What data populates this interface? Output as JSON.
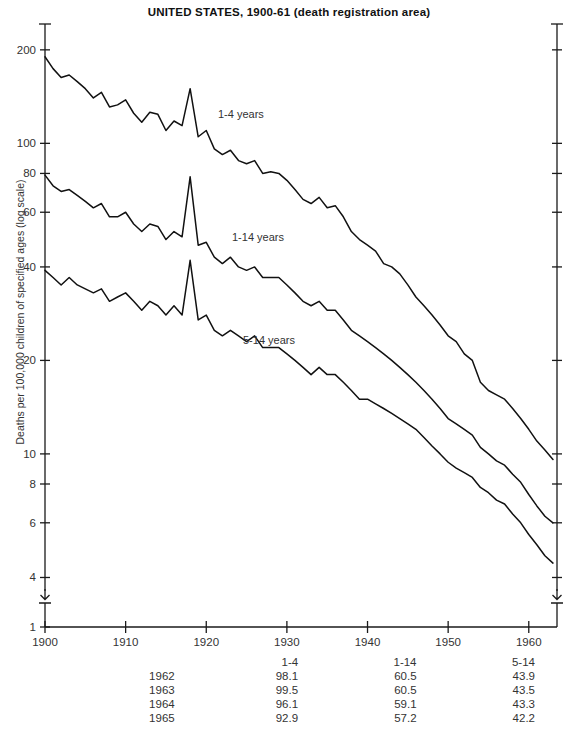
{
  "chart_data": {
    "type": "line",
    "title": "UNITED STATES, 1900-61 (death registration area)",
    "ylabel": "Deaths per 100,000 children of specified ages (log scale)",
    "xlabel": "",
    "scale": "log",
    "grid": false,
    "legend_position": "inline-annotations",
    "xlim": [
      1900,
      1963.5
    ],
    "ylim": [
      3.7,
      230
    ],
    "xticks": [
      1900,
      1910,
      1920,
      1930,
      1940,
      1950,
      1960
    ],
    "xtick_labels": [
      "1900",
      "1910",
      "1920",
      "1930",
      "1940",
      "1950",
      "1960"
    ],
    "yticks": [
      200,
      100,
      80,
      60,
      40,
      20,
      10,
      8,
      6,
      4,
      1
    ],
    "ytick_labels": [
      "200",
      "100",
      "80",
      "60",
      "40",
      "20",
      "10",
      "8",
      "6",
      "4",
      "1"
    ],
    "axis_break": true,
    "x": [
      1900,
      1901,
      1902,
      1903,
      1904,
      1905,
      1906,
      1907,
      1908,
      1909,
      1910,
      1911,
      1912,
      1913,
      1914,
      1915,
      1916,
      1917,
      1918,
      1919,
      1920,
      1921,
      1922,
      1923,
      1924,
      1925,
      1926,
      1927,
      1928,
      1929,
      1930,
      1931,
      1932,
      1933,
      1934,
      1935,
      1936,
      1937,
      1938,
      1939,
      1940,
      1941,
      1942,
      1943,
      1944,
      1945,
      1946,
      1947,
      1948,
      1949,
      1950,
      1951,
      1952,
      1953,
      1954,
      1955,
      1956,
      1957,
      1958,
      1959,
      1960,
      1961,
      1962,
      1963
    ],
    "series": [
      {
        "name": "1-4 years",
        "label": "1-4 years",
        "values": [
          190,
          174,
          163,
          166,
          158,
          150,
          140,
          146,
          131,
          133,
          138,
          125,
          117,
          126,
          124,
          110,
          118,
          114,
          150,
          105,
          110,
          96,
          92,
          95,
          88,
          86,
          88,
          80,
          81,
          80,
          76,
          71,
          66,
          64,
          67,
          62,
          63,
          58,
          52,
          49,
          47,
          45,
          41,
          40,
          38,
          35,
          32,
          30,
          28,
          26,
          24,
          23,
          21,
          20,
          17,
          16,
          15.5,
          15,
          14,
          13,
          12,
          11,
          10.3,
          9.6
        ]
      },
      {
        "name": "1-14 years",
        "label": "1-14 years",
        "values": [
          79,
          73,
          70,
          71,
          68,
          65,
          62,
          64,
          58,
          58,
          60,
          55,
          52,
          55,
          54,
          49,
          52,
          50,
          78,
          47,
          48,
          43,
          41,
          43,
          40,
          39,
          40,
          37,
          37,
          37,
          35,
          33,
          31,
          30,
          31,
          29,
          29,
          27,
          25,
          24,
          23,
          22,
          21,
          20,
          19,
          18,
          17,
          16,
          15,
          14,
          13,
          12.5,
          12,
          11.5,
          10.5,
          10,
          9.5,
          9.2,
          8.6,
          8.1,
          7.4,
          6.8,
          6.3,
          6.0
        ]
      },
      {
        "name": "5-14 years",
        "label": "5-14 years",
        "values": [
          39,
          37,
          35,
          37,
          35,
          34,
          33,
          34,
          31,
          32,
          33,
          31,
          29,
          31,
          30,
          28,
          30,
          28,
          42,
          27,
          28,
          25,
          24,
          25,
          24,
          23,
          24,
          22,
          22,
          22,
          21,
          20,
          19,
          18,
          19,
          18,
          18,
          17,
          16,
          15,
          15,
          14.5,
          14,
          13.5,
          13,
          12.5,
          12,
          11.3,
          10.6,
          10,
          9.4,
          9.0,
          8.7,
          8.4,
          7.8,
          7.5,
          7.1,
          6.9,
          6.4,
          6.0,
          5.5,
          5.1,
          4.7,
          4.45
        ]
      }
    ],
    "table": {
      "row_header_label": "",
      "columns": [
        "1-4",
        "1-14",
        "5-14"
      ],
      "rows": [
        {
          "year": "1962",
          "values": [
            "98.1",
            "60.5",
            "43.9"
          ]
        },
        {
          "year": "1963",
          "values": [
            "99.5",
            "60.5",
            "43.5"
          ]
        },
        {
          "year": "1964",
          "values": [
            "96.1",
            "59.1",
            "43.3"
          ]
        },
        {
          "year": "1965",
          "values": [
            "92.9",
            "57.2",
            "42.2"
          ]
        }
      ]
    }
  }
}
